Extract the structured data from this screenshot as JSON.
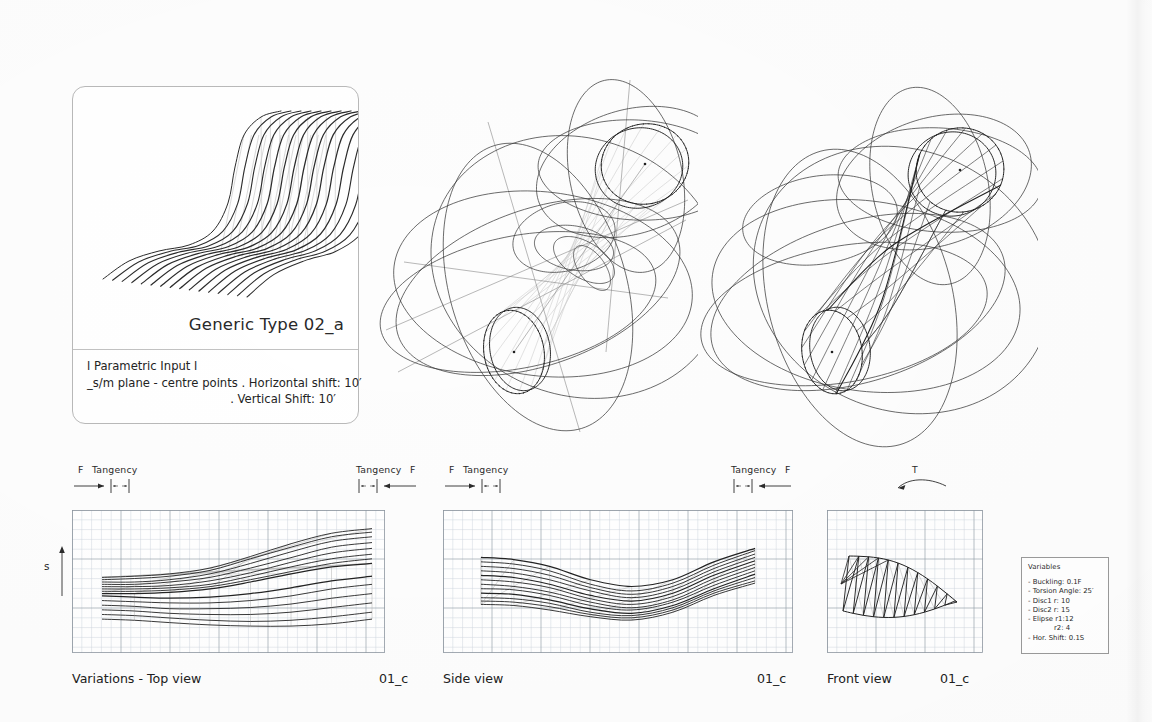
{
  "sheet": {
    "title": "Parametric Ruled-Surface Study Sheet"
  },
  "spec_card": {
    "title": "Generic Type 02_a",
    "body_lines": [
      "l Parametric Input l",
      "_s/m plane - centre points . Horizontal shift: 10′",
      ". Vertical Shift: 10′"
    ],
    "figure_name": "family-of-s-curves"
  },
  "annotations": {
    "top_view": {
      "left_force": "F",
      "left_tangency": "Tangency",
      "right_tangency": "Tangency",
      "right_force": "F"
    },
    "side_view": {
      "left_force": "F",
      "left_tangency": "Tangency",
      "right_tangency": "Tangency",
      "right_force": "F"
    },
    "front_view": {
      "torsion": "T"
    },
    "s_axis_label": "s"
  },
  "views": [
    {
      "caption": "Variations - Top view",
      "code": "01_c",
      "plot": "top"
    },
    {
      "caption": "Side view",
      "code": "01_c",
      "plot": "side"
    },
    {
      "caption": "Front view",
      "code": "01_c",
      "plot": "front"
    }
  ],
  "variables": {
    "title": "Variables",
    "items": [
      "- Buckling: 0.1F",
      "- Torsion Angle: 25′",
      "- Disc1 r: 10",
      "- Disc2 r: 15",
      "- Elipse r1:12",
      "r2: 4",
      "- Hor. Shift: 0.1S"
    ]
  },
  "colors": {
    "ink": "#1b1b1b",
    "line": "#2a2a2a",
    "grid_fine": "#cfd6de",
    "grid_major": "#9aa3ad",
    "card_border": "#b9b9b9",
    "construction": "#555555",
    "ghost": "#b8b8b8",
    "paper": "#fdfdfd"
  },
  "chart_data": [
    {
      "type": "line",
      "title": "Variations - Top view",
      "xlabel": "",
      "ylabel": "s",
      "grid": true,
      "n_curves": 14,
      "description": "Family of ruled-surface generatrices projected on the horizontal plane; curves fan out from a tight left bundle and splay toward the right.",
      "x": [
        0,
        0.12,
        0.25,
        0.4,
        0.55,
        0.7,
        0.85,
        1.0
      ],
      "series": [
        {
          "name": "g1",
          "values": [
            0.4,
            0.4,
            0.41,
            0.44,
            0.5,
            0.57,
            0.63,
            0.66
          ]
        },
        {
          "name": "g2",
          "values": [
            0.42,
            0.42,
            0.43,
            0.46,
            0.52,
            0.59,
            0.66,
            0.7
          ]
        },
        {
          "name": "g3",
          "values": [
            0.44,
            0.44,
            0.45,
            0.48,
            0.55,
            0.63,
            0.7,
            0.74
          ]
        },
        {
          "name": "g4",
          "values": [
            0.46,
            0.46,
            0.47,
            0.51,
            0.58,
            0.67,
            0.75,
            0.79
          ]
        },
        {
          "name": "g5",
          "values": [
            0.48,
            0.48,
            0.5,
            0.54,
            0.62,
            0.71,
            0.8,
            0.84
          ]
        },
        {
          "name": "g6",
          "values": [
            0.5,
            0.5,
            0.52,
            0.57,
            0.66,
            0.76,
            0.85,
            0.89
          ]
        },
        {
          "name": "g7",
          "values": [
            0.52,
            0.53,
            0.55,
            0.6,
            0.7,
            0.8,
            0.89,
            0.93
          ]
        },
        {
          "name": "g8",
          "values": [
            0.54,
            0.55,
            0.57,
            0.62,
            0.72,
            0.83,
            0.92,
            0.96
          ]
        },
        {
          "name": "g9",
          "values": [
            0.38,
            0.37,
            0.36,
            0.37,
            0.4,
            0.45,
            0.51,
            0.55
          ]
        },
        {
          "name": "g10",
          "values": [
            0.34,
            0.33,
            0.32,
            0.32,
            0.34,
            0.38,
            0.44,
            0.48
          ]
        },
        {
          "name": "g11",
          "values": [
            0.3,
            0.29,
            0.27,
            0.27,
            0.28,
            0.31,
            0.36,
            0.4
          ]
        },
        {
          "name": "g12",
          "values": [
            0.26,
            0.25,
            0.23,
            0.22,
            0.22,
            0.24,
            0.28,
            0.32
          ]
        },
        {
          "name": "g13",
          "values": [
            0.22,
            0.21,
            0.19,
            0.17,
            0.16,
            0.17,
            0.2,
            0.24
          ]
        },
        {
          "name": "g14",
          "values": [
            0.18,
            0.17,
            0.15,
            0.13,
            0.12,
            0.12,
            0.14,
            0.18
          ]
        }
      ]
    },
    {
      "type": "line",
      "title": "Side view",
      "xlabel": "",
      "ylabel": "",
      "grid": true,
      "n_curves": 12,
      "description": "S-shaped profile curves descending then rising; bundle pinches near x=0.6 and expands at both ends.",
      "x": [
        0,
        0.12,
        0.25,
        0.4,
        0.55,
        0.7,
        0.85,
        1.0
      ],
      "series": [
        {
          "name": "p1",
          "values": [
            0.72,
            0.7,
            0.64,
            0.52,
            0.46,
            0.52,
            0.68,
            0.8
          ]
        },
        {
          "name": "p2",
          "values": [
            0.68,
            0.66,
            0.6,
            0.48,
            0.42,
            0.49,
            0.65,
            0.78
          ]
        },
        {
          "name": "p3",
          "values": [
            0.64,
            0.62,
            0.56,
            0.45,
            0.39,
            0.46,
            0.62,
            0.75
          ]
        },
        {
          "name": "p4",
          "values": [
            0.6,
            0.58,
            0.52,
            0.42,
            0.36,
            0.43,
            0.59,
            0.72
          ]
        },
        {
          "name": "p5",
          "values": [
            0.56,
            0.54,
            0.48,
            0.38,
            0.33,
            0.4,
            0.56,
            0.69
          ]
        },
        {
          "name": "p6",
          "values": [
            0.52,
            0.5,
            0.45,
            0.35,
            0.3,
            0.37,
            0.53,
            0.66
          ]
        },
        {
          "name": "p7",
          "values": [
            0.48,
            0.46,
            0.41,
            0.32,
            0.27,
            0.34,
            0.5,
            0.63
          ]
        },
        {
          "name": "p8",
          "values": [
            0.44,
            0.43,
            0.38,
            0.29,
            0.25,
            0.32,
            0.47,
            0.6
          ]
        },
        {
          "name": "p9",
          "values": [
            0.4,
            0.39,
            0.34,
            0.26,
            0.22,
            0.29,
            0.44,
            0.57
          ]
        },
        {
          "name": "p10",
          "values": [
            0.36,
            0.35,
            0.31,
            0.23,
            0.2,
            0.27,
            0.42,
            0.54
          ]
        },
        {
          "name": "p11",
          "values": [
            0.33,
            0.32,
            0.28,
            0.21,
            0.18,
            0.25,
            0.4,
            0.51
          ]
        },
        {
          "name": "p12",
          "values": [
            0.3,
            0.29,
            0.25,
            0.19,
            0.16,
            0.23,
            0.38,
            0.49
          ]
        }
      ]
    },
    {
      "type": "line",
      "title": "Front view",
      "xlabel": "",
      "ylabel": "",
      "grid": true,
      "n_curves": 11,
      "description": "End-on projection of the torsioned ruled surface; straight generatrices cross in a zig-zag lattice forming a leaf-shaped envelope.",
      "envelope": [
        [
          0.12,
          0.38
        ],
        [
          0.3,
          0.72
        ],
        [
          0.62,
          0.8
        ],
        [
          0.86,
          0.4
        ],
        [
          0.55,
          0.14
        ],
        [
          0.22,
          0.22
        ]
      ]
    }
  ]
}
